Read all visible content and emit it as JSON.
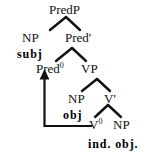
{
  "diagram": {
    "type": "syntax-tree",
    "nodes": {
      "predp": "PredP",
      "np_subj": "NP",
      "pred_bar": "Pred'",
      "pred0_base": "Pred",
      "pred0_sup": "0",
      "vp": "VP",
      "np_obj": "NP",
      "v_bar": "V'",
      "v0_base": "V",
      "v0_sup": "0",
      "np_indobj": "NP"
    },
    "glosses": {
      "subj": "subj",
      "obj": "obj",
      "ind_obj": "ind. obj."
    },
    "movement": {
      "label": "head-movement-arrow",
      "from": "V0",
      "to": "Pred0"
    },
    "colors": {
      "ink": "#111111",
      "background": "#ffffff"
    }
  }
}
